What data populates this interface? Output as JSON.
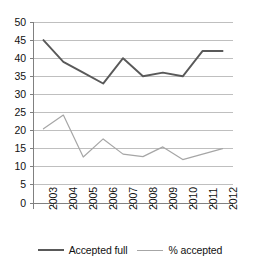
{
  "chart_data": {
    "type": "line",
    "title": "",
    "subtitle": "",
    "xlabel": "",
    "ylabel": "",
    "categories": [
      "2003",
      "2004",
      "2005",
      "2006",
      "2007",
      "2008",
      "2009",
      "2010",
      "2011",
      "2012"
    ],
    "series": [
      {
        "name": "Accepted full",
        "color": "#595959",
        "values": [
          45,
          39,
          36,
          33,
          40,
          35,
          36,
          35,
          42,
          42
        ]
      },
      {
        "name": "% accepted",
        "color": "#a6a6a6",
        "values": [
          20.5,
          24.3,
          12.7,
          17.7,
          13.5,
          12.8,
          15.5,
          12,
          13.5,
          15
        ]
      }
    ],
    "ylim": [
      0,
      50
    ],
    "yticks": [
      0,
      5,
      10,
      15,
      20,
      25,
      30,
      35,
      40,
      45,
      50
    ],
    "ytick_labels": [
      "0",
      "5",
      "10",
      "15",
      "20",
      "25",
      "30",
      "35",
      "40",
      "45",
      "50"
    ],
    "grid": true,
    "grid_axis": "y",
    "grid_color": "#bfbfbf",
    "axis_color": "#808080",
    "legend_position": "bottom",
    "background": "#ffffff"
  },
  "legend": {
    "entries": [
      {
        "label": "Accepted full",
        "color": "#595959",
        "width": "2.2px"
      },
      {
        "label": "% accepted",
        "color": "#a6a6a6",
        "width": "1.3px"
      }
    ]
  }
}
